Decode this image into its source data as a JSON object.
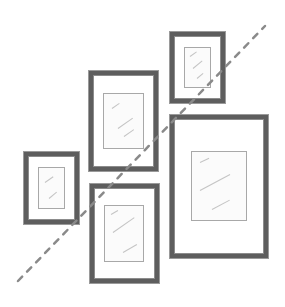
{
  "illustration": {
    "subject": "gallery wall arrangement sketch",
    "background": "#ffffff",
    "frame_color": "#5e5e5e",
    "mat_border_color": "#a8a8a8",
    "guide_line_color": "#8a8a8a",
    "frames": [
      {
        "id": "top-right-small",
        "outer": [
          170,
          32,
          55,
          71
        ],
        "inner": [
          184,
          47,
          27,
          41
        ]
      },
      {
        "id": "center-top",
        "outer": [
          89,
          71,
          69,
          100
        ],
        "inner": [
          103,
          93,
          41,
          56
        ]
      },
      {
        "id": "right-large",
        "outer": [
          170,
          115,
          98,
          143
        ],
        "inner": [
          191,
          151,
          56,
          70
        ]
      },
      {
        "id": "left-small",
        "outer": [
          24,
          152,
          55,
          72
        ],
        "inner": [
          38,
          167,
          27,
          42
        ]
      },
      {
        "id": "center-bottom",
        "outer": [
          90,
          184,
          69,
          99
        ],
        "inner": [
          104,
          205,
          40,
          57
        ]
      }
    ],
    "guide_line": {
      "style": "dashed",
      "from": [
        18,
        281
      ],
      "to": [
        265,
        26
      ]
    }
  }
}
